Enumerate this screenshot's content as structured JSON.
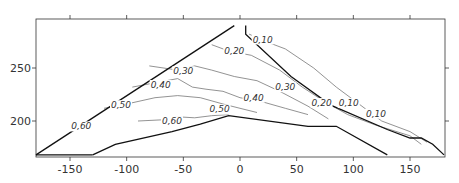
{
  "chart_data": {
    "type": "contour",
    "title": "",
    "xlabel": "",
    "ylabel": "",
    "xlim": [
      -180,
      180
    ],
    "ylim": [
      168,
      290
    ],
    "x_ticks": [
      -150,
      -100,
      -50,
      0,
      50,
      100,
      150
    ],
    "x_tick_labels": [
      "-150",
      "-100",
      "-50",
      "0",
      "50",
      "100",
      "150"
    ],
    "y_ticks": [
      200,
      250
    ],
    "y_tick_labels": [
      "200",
      "250"
    ],
    "grid": false,
    "legend": "none",
    "boundary_upper_left": [
      [
        -180,
        168
      ],
      [
        -5,
        290
      ]
    ],
    "boundary_upper_right": [
      [
        5,
        290
      ],
      [
        5,
        282
      ],
      [
        45,
        242
      ],
      [
        80,
        215
      ],
      [
        130,
        192
      ],
      [
        150,
        184
      ],
      [
        160,
        184
      ],
      [
        170,
        178
      ],
      [
        180,
        168
      ]
    ],
    "boundary_lower": [
      [
        -130,
        168
      ],
      [
        -110,
        178
      ],
      [
        -60,
        190
      ],
      [
        -35,
        197
      ],
      [
        -10,
        205
      ],
      [
        60,
        195
      ],
      [
        85,
        195
      ],
      [
        130,
        168
      ]
    ],
    "contour_levels": [
      "0,10",
      "0,20",
      "0,30",
      "0,40",
      "0,50",
      "0,60"
    ],
    "contour_labels": [
      {
        "text": "0,10",
        "x": 20,
        "y": 275
      },
      {
        "text": "0,20",
        "x": -5,
        "y": 264
      },
      {
        "text": "0,30",
        "x": -50,
        "y": 245
      },
      {
        "text": "0,40",
        "x": -70,
        "y": 232
      },
      {
        "text": "0,50",
        "x": -105,
        "y": 213
      },
      {
        "text": "0,60",
        "x": -140,
        "y": 193
      },
      {
        "text": "0,60",
        "x": -60,
        "y": 198
      },
      {
        "text": "0,50",
        "x": -18,
        "y": 209
      },
      {
        "text": "0,40",
        "x": 12,
        "y": 220
      },
      {
        "text": "0,30",
        "x": 40,
        "y": 230
      },
      {
        "text": "0,20",
        "x": 72,
        "y": 215
      },
      {
        "text": "0,10",
        "x": 96,
        "y": 215
      },
      {
        "text": "0,10",
        "x": 120,
        "y": 205
      }
    ],
    "contours": [
      {
        "level": "0,10",
        "points": [
          [
            8,
            282
          ],
          [
            20,
            276
          ],
          [
            40,
            268
          ],
          [
            65,
            250
          ],
          [
            85,
            232
          ],
          [
            105,
            216
          ],
          [
            125,
            200
          ],
          [
            150,
            190
          ],
          [
            165,
            180
          ]
        ]
      },
      {
        "level": "0,20",
        "points": [
          [
            -25,
            272
          ],
          [
            -10,
            266
          ],
          [
            10,
            262
          ],
          [
            35,
            248
          ],
          [
            55,
            232
          ],
          [
            75,
            218
          ],
          [
            95,
            206
          ],
          [
            120,
            196
          ],
          [
            150,
            186
          ],
          [
            160,
            178
          ]
        ]
      },
      {
        "level": "0,30",
        "points": [
          [
            -80,
            252
          ],
          [
            -55,
            248
          ],
          [
            -40,
            252
          ],
          [
            -25,
            248
          ],
          [
            -5,
            242
          ],
          [
            15,
            238
          ],
          [
            35,
            228
          ],
          [
            60,
            214
          ],
          [
            78,
            202
          ]
        ]
      },
      {
        "level": "0,40",
        "points": [
          [
            -95,
            232
          ],
          [
            -75,
            236
          ],
          [
            -55,
            240
          ],
          [
            -42,
            232
          ],
          [
            -30,
            230
          ],
          [
            -15,
            228
          ],
          [
            0,
            222
          ],
          [
            20,
            218
          ],
          [
            40,
            212
          ],
          [
            60,
            206
          ]
        ]
      },
      {
        "level": "0,50",
        "points": [
          [
            -120,
            212
          ],
          [
            -100,
            216
          ],
          [
            -75,
            222
          ],
          [
            -55,
            224
          ],
          [
            -35,
            222
          ],
          [
            -15,
            216
          ],
          [
            0,
            212
          ],
          [
            15,
            208
          ]
        ]
      },
      {
        "level": "0,60",
        "points": [
          [
            -90,
            200
          ],
          [
            -70,
            201
          ],
          [
            -55,
            204
          ],
          [
            -40,
            203
          ],
          [
            -25,
            205
          ],
          [
            -10,
            206
          ]
        ]
      }
    ]
  }
}
